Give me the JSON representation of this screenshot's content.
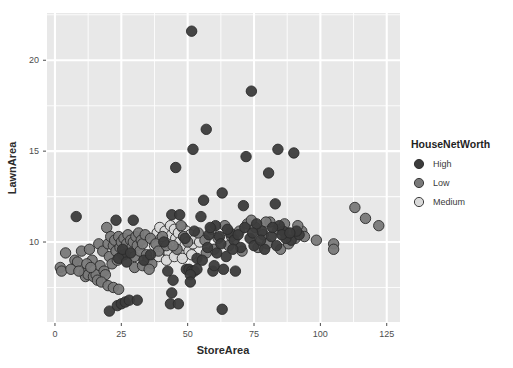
{
  "chart_data": {
    "type": "scatter",
    "title": "",
    "xlabel": "StoreArea",
    "ylabel": "LawnArea",
    "xlim": [
      -3,
      130
    ],
    "ylim": [
      5.6,
      22.6
    ],
    "xticks": [
      0,
      25,
      50,
      75,
      100,
      125
    ],
    "yticks": [
      10,
      15,
      20
    ],
    "xtick_labels": [
      "0",
      "25",
      "50",
      "75",
      "100",
      "125"
    ],
    "ytick_labels": [
      "10",
      "15",
      "20"
    ],
    "grid": true,
    "grid_color": "#ffffff",
    "panel_background": "#e8e8e8",
    "legend": {
      "title": "HouseNetWorth",
      "position": "right",
      "entries": [
        {
          "name": "High",
          "color": "#3c3c3c"
        },
        {
          "name": "Low",
          "color": "#797979"
        },
        {
          "name": "Medium",
          "color": "#d9d9d9"
        }
      ]
    },
    "point_size": 5.2,
    "point_stroke": "#2a2a2a",
    "series": [
      {
        "name": "High",
        "color": "#3c3c3c",
        "points": [
          [
            51.5,
            21.6
          ],
          [
            74.0,
            18.3
          ],
          [
            57.0,
            16.2
          ],
          [
            52.0,
            15.1
          ],
          [
            84.0,
            15.1
          ],
          [
            90.0,
            14.9
          ],
          [
            72.0,
            14.7
          ],
          [
            45.5,
            14.1
          ],
          [
            80.5,
            13.8
          ],
          [
            63.0,
            12.7
          ],
          [
            56.0,
            12.3
          ],
          [
            83.0,
            12.1
          ],
          [
            71.0,
            12.0
          ],
          [
            8.0,
            11.4
          ],
          [
            29.5,
            11.2
          ],
          [
            44.0,
            11.5
          ],
          [
            47.0,
            11.5
          ],
          [
            55.0,
            11.4
          ],
          [
            60.5,
            10.9
          ],
          [
            52.5,
            10.6
          ],
          [
            58.0,
            10.4
          ],
          [
            62.0,
            10.3
          ],
          [
            66.0,
            10.5
          ],
          [
            67.5,
            10.1
          ],
          [
            57.5,
            9.7
          ],
          [
            61.0,
            9.4
          ],
          [
            53.5,
            9.1
          ],
          [
            64.5,
            9.2
          ],
          [
            68.0,
            8.4
          ],
          [
            63.5,
            8.5
          ],
          [
            59.5,
            8.4
          ],
          [
            60.0,
            8.7
          ],
          [
            49.5,
            8.5
          ],
          [
            50.5,
            8.5
          ],
          [
            51.5,
            8.4
          ],
          [
            52.5,
            8.4
          ],
          [
            53.5,
            8.5
          ],
          [
            51.0,
            8.2
          ],
          [
            42.5,
            8.4
          ],
          [
            44.5,
            7.9
          ],
          [
            51.0,
            7.8
          ],
          [
            44.0,
            7.2
          ],
          [
            43.5,
            6.6
          ],
          [
            46.5,
            6.6
          ],
          [
            63.0,
            6.3
          ],
          [
            20.5,
            6.2
          ],
          [
            23.5,
            6.5
          ],
          [
            25.0,
            6.6
          ],
          [
            26.5,
            6.7
          ],
          [
            28.0,
            6.8
          ],
          [
            31.0,
            6.8
          ],
          [
            33.5,
            9.0
          ],
          [
            36.0,
            9.3
          ],
          [
            23.0,
            11.2
          ],
          [
            41.0,
            10.0
          ],
          [
            55.5,
            9.0
          ],
          [
            58.5,
            10.8
          ],
          [
            49.0,
            10.2
          ],
          [
            70.0,
            9.7
          ],
          [
            73.5,
            10.2
          ],
          [
            78.0,
            10.6
          ],
          [
            81.5,
            10.3
          ],
          [
            86.0,
            10.6
          ],
          [
            89.0,
            10.1
          ],
          [
            92.0,
            10.4
          ],
          [
            76.0,
            11.0
          ],
          [
            84.5,
            10.9
          ],
          [
            69.0,
            10.4
          ],
          [
            65.0,
            10.7
          ],
          [
            75.0,
            9.8
          ],
          [
            79.0,
            9.6
          ],
          [
            83.5,
            9.8
          ],
          [
            87.0,
            10.2
          ],
          [
            91.0,
            10.6
          ],
          [
            62.5,
            9.9
          ],
          [
            67.0,
            9.6
          ],
          [
            71.5,
            10.8
          ],
          [
            74.5,
            10.5
          ],
          [
            77.5,
            10.1
          ],
          [
            82.0,
            10.8
          ],
          [
            85.5,
            10.4
          ],
          [
            88.5,
            10.5
          ],
          [
            26.0,
            9.3
          ],
          [
            24.0,
            9.1
          ],
          [
            27.0,
            8.9
          ],
          [
            25.5,
            9.6
          ],
          [
            28.5,
            9.4
          ]
        ]
      },
      {
        "name": "Low",
        "color": "#797979",
        "points": [
          [
            2.0,
            8.6
          ],
          [
            2.5,
            8.4
          ],
          [
            4.0,
            9.4
          ],
          [
            7.5,
            9.0
          ],
          [
            8.5,
            8.9
          ],
          [
            10.0,
            9.5
          ],
          [
            11.0,
            8.3
          ],
          [
            11.5,
            8.1
          ],
          [
            12.5,
            8.2
          ],
          [
            13.0,
            9.6
          ],
          [
            14.0,
            9.0
          ],
          [
            14.5,
            8.1
          ],
          [
            15.5,
            8.2
          ],
          [
            16.5,
            9.9
          ],
          [
            17.0,
            8.7
          ],
          [
            18.0,
            9.5
          ],
          [
            18.5,
            8.4
          ],
          [
            19.0,
            8.2
          ],
          [
            19.5,
            10.8
          ],
          [
            20.0,
            9.9
          ],
          [
            20.5,
            9.2
          ],
          [
            21.0,
            10.3
          ],
          [
            21.5,
            8.8
          ],
          [
            22.0,
            9.8
          ],
          [
            22.5,
            10.1
          ],
          [
            23.0,
            9.5
          ],
          [
            23.5,
            9.0
          ],
          [
            24.0,
            10.3
          ],
          [
            24.5,
            9.7
          ],
          [
            25.0,
            10.0
          ],
          [
            25.5,
            9.3
          ],
          [
            26.0,
            10.2
          ],
          [
            26.5,
            9.6
          ],
          [
            27.0,
            9.9
          ],
          [
            27.5,
            10.4
          ],
          [
            28.0,
            9.4
          ],
          [
            28.5,
            10.1
          ],
          [
            29.0,
            9.7
          ],
          [
            29.5,
            10.0
          ],
          [
            30.0,
            9.2
          ],
          [
            30.5,
            10.3
          ],
          [
            31.0,
            9.8
          ],
          [
            31.5,
            10.5
          ],
          [
            32.0,
            9.5
          ],
          [
            32.5,
            10.1
          ],
          [
            33.0,
            9.9
          ],
          [
            34.0,
            10.4
          ],
          [
            34.5,
            9.3
          ],
          [
            35.0,
            9.0
          ],
          [
            36.0,
            10.2
          ],
          [
            36.5,
            8.8
          ],
          [
            6.0,
            8.5
          ],
          [
            9.0,
            8.4
          ],
          [
            16.0,
            7.9
          ],
          [
            17.5,
            7.8
          ],
          [
            20.0,
            7.6
          ],
          [
            22.0,
            7.5
          ],
          [
            24.0,
            7.4
          ],
          [
            12.0,
            8.8
          ],
          [
            13.5,
            8.6
          ],
          [
            30.0,
            8.6
          ],
          [
            33.0,
            8.7
          ],
          [
            35.5,
            8.5
          ],
          [
            38.0,
            9.9
          ],
          [
            39.0,
            9.5
          ],
          [
            40.5,
            10.3
          ],
          [
            42.0,
            9.8
          ],
          [
            54.0,
            10.5
          ],
          [
            56.5,
            10.1
          ],
          [
            59.0,
            10.7
          ],
          [
            61.5,
            10.2
          ],
          [
            64.0,
            10.9
          ],
          [
            66.5,
            10.3
          ],
          [
            69.5,
            10.6
          ],
          [
            72.5,
            11.0
          ],
          [
            75.5,
            10.8
          ],
          [
            78.5,
            10.4
          ],
          [
            81.0,
            11.1
          ],
          [
            84.0,
            10.7
          ],
          [
            87.5,
            10.5
          ],
          [
            90.5,
            10.2
          ],
          [
            93.0,
            10.6
          ],
          [
            94.0,
            10.3
          ],
          [
            98.5,
            10.1
          ],
          [
            105.0,
            9.9
          ],
          [
            105.0,
            9.6
          ],
          [
            113.0,
            11.9
          ],
          [
            117.0,
            11.3
          ],
          [
            122.0,
            10.9
          ],
          [
            47.5,
            10.9
          ],
          [
            48.5,
            10.3
          ],
          [
            50.0,
            10.0
          ],
          [
            46.0,
            9.6
          ],
          [
            44.5,
            9.8
          ],
          [
            57.0,
            9.4
          ],
          [
            60.0,
            9.6
          ],
          [
            65.5,
            9.8
          ],
          [
            70.5,
            9.5
          ],
          [
            76.5,
            9.7
          ],
          [
            80.0,
            9.9
          ],
          [
            85.0,
            9.6
          ],
          [
            88.0,
            9.9
          ],
          [
            91.5,
            10.9
          ],
          [
            74.0,
            11.2
          ],
          [
            79.5,
            11.1
          ],
          [
            86.5,
            11.0
          ]
        ]
      },
      {
        "name": "Medium",
        "color": "#d9d9d9",
        "points": [
          [
            38.5,
            10.5
          ],
          [
            39.5,
            10.8
          ],
          [
            40.0,
            10.2
          ],
          [
            41.0,
            9.6
          ],
          [
            41.5,
            10.6
          ],
          [
            42.5,
            10.1
          ],
          [
            43.0,
            9.4
          ],
          [
            43.5,
            10.9
          ],
          [
            44.0,
            10.4
          ],
          [
            44.5,
            9.9
          ],
          [
            45.0,
            10.7
          ],
          [
            45.5,
            10.2
          ],
          [
            46.0,
            9.5
          ],
          [
            46.5,
            10.5
          ],
          [
            47.0,
            10.0
          ],
          [
            47.5,
            9.3
          ],
          [
            48.0,
            10.8
          ],
          [
            48.5,
            10.3
          ],
          [
            49.0,
            9.8
          ],
          [
            49.5,
            10.6
          ],
          [
            50.0,
            10.1
          ],
          [
            50.5,
            9.5
          ],
          [
            51.0,
            10.4
          ],
          [
            52.0,
            9.9
          ],
          [
            53.0,
            10.2
          ],
          [
            39.0,
            9.2
          ],
          [
            42.0,
            9.0
          ],
          [
            45.0,
            9.2
          ],
          [
            48.0,
            9.1
          ],
          [
            51.5,
            9.3
          ],
          [
            54.5,
            10.0
          ],
          [
            37.5,
            9.8
          ]
        ]
      }
    ]
  },
  "axes": {
    "x_title": "StoreArea",
    "y_title": "LawnArea"
  }
}
